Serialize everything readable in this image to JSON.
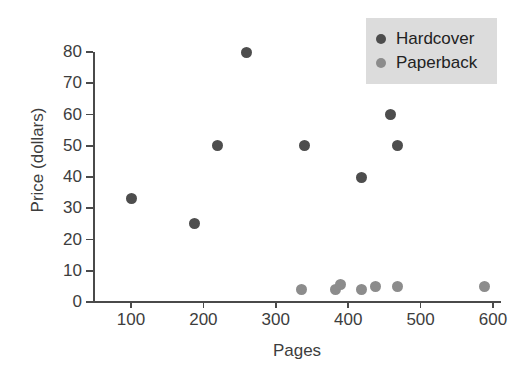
{
  "chart_data": {
    "type": "scatter",
    "title": "",
    "xlabel": "Pages",
    "ylabel": "Price (dollars)",
    "xlim": [
      52,
      620
    ],
    "ylim": [
      0,
      80
    ],
    "xticks": [
      100,
      200,
      300,
      400,
      500,
      600
    ],
    "yticks": [
      0,
      10,
      20,
      30,
      40,
      50,
      60,
      70,
      80
    ],
    "xtick_labels": [
      "100",
      "200",
      "300",
      "400",
      "500",
      "600"
    ],
    "ytick_labels": [
      "0",
      "10",
      "20",
      "30",
      "40",
      "50",
      "60",
      "70",
      "80"
    ],
    "grid": false,
    "legend_position": "top-right",
    "series": [
      {
        "name": "Hardcover",
        "color": "#4d4d4d",
        "points": [
          {
            "x": 100,
            "y": 33
          },
          {
            "x": 188,
            "y": 25
          },
          {
            "x": 220,
            "y": 50
          },
          {
            "x": 260,
            "y": 80
          },
          {
            "x": 340,
            "y": 50
          },
          {
            "x": 418,
            "y": 40
          },
          {
            "x": 458,
            "y": 60
          },
          {
            "x": 468,
            "y": 50
          }
        ]
      },
      {
        "name": "Paperback",
        "color": "#8c8c8c",
        "points": [
          {
            "x": 335,
            "y": 4
          },
          {
            "x": 383,
            "y": 4
          },
          {
            "x": 390,
            "y": 5.5
          },
          {
            "x": 418,
            "y": 4
          },
          {
            "x": 438,
            "y": 5
          },
          {
            "x": 468,
            "y": 5
          },
          {
            "x": 588,
            "y": 5
          }
        ]
      }
    ]
  },
  "legend": {
    "background": "#dcdcdc",
    "items": [
      {
        "label": "Hardcover",
        "color": "#4d4d4d"
      },
      {
        "label": "Paperback",
        "color": "#8c8c8c"
      }
    ]
  },
  "axes": {
    "x_title": "Pages",
    "y_title": "Price (dollars)",
    "axis_color": "#4a4a4a",
    "text_color": "#3d3d3d"
  }
}
